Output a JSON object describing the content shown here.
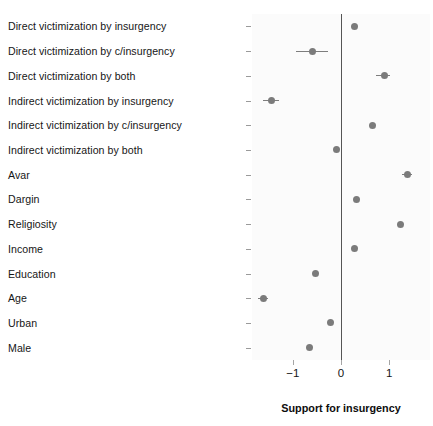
{
  "chart_data": {
    "type": "scatter",
    "title": "",
    "subtitle": "",
    "xlabel": "Support for insurgency",
    "ylabel": "",
    "xlim": [
      -1.85,
      1.85
    ],
    "xticks": [
      -1,
      0,
      1
    ],
    "xticklabels": [
      "−1",
      "0",
      "1"
    ],
    "grid": false,
    "legend": null,
    "reference_line": {
      "x": 0,
      "label": "zero-line"
    },
    "orientation": "horizontal",
    "categories": [
      "Direct victimization by insurgency",
      "Direct victimization by c/insurgency",
      "Direct victimization by both",
      "Indirect victimization by insurgency",
      "Indirect victimization by c/insurgency",
      "Indirect victimization by both",
      "Avar",
      "Dargin",
      "Religiosity",
      "Income",
      "Education",
      "Age",
      "Urban",
      "Male"
    ],
    "values": [
      0.28,
      -0.59,
      0.91,
      -1.45,
      0.65,
      -0.09,
      1.39,
      0.33,
      1.24,
      0.28,
      -0.53,
      -1.62,
      -0.22,
      -0.65
    ],
    "ci_low": [
      0.28,
      -0.93,
      0.73,
      -1.62,
      0.65,
      -0.09,
      1.27,
      0.33,
      1.24,
      0.28,
      -0.53,
      -1.73,
      -0.22,
      -0.65
    ],
    "ci_high": [
      0.28,
      -0.26,
      1.02,
      -1.28,
      0.65,
      -0.09,
      1.48,
      0.33,
      1.24,
      0.28,
      -0.53,
      -1.51,
      -0.22,
      -0.65
    ],
    "points": [
      {
        "label": "Direct victimization by insurgency",
        "value": 0.28,
        "ci_low": 0.28,
        "ci_high": 0.28
      },
      {
        "label": "Direct victimization by c/insurgency",
        "value": -0.59,
        "ci_low": -0.93,
        "ci_high": -0.26
      },
      {
        "label": "Direct victimization by both",
        "value": 0.91,
        "ci_low": 0.73,
        "ci_high": 1.02
      },
      {
        "label": "Indirect victimization by insurgency",
        "value": -1.45,
        "ci_low": -1.62,
        "ci_high": -1.28
      },
      {
        "label": "Indirect victimization by c/insurgency",
        "value": 0.65,
        "ci_low": 0.65,
        "ci_high": 0.65
      },
      {
        "label": "Indirect victimization by both",
        "value": -0.09,
        "ci_low": -0.09,
        "ci_high": -0.09
      },
      {
        "label": "Avar",
        "value": 1.39,
        "ci_low": 1.27,
        "ci_high": 1.48
      },
      {
        "label": "Dargin",
        "value": 0.33,
        "ci_low": 0.33,
        "ci_high": 0.33
      },
      {
        "label": "Religiosity",
        "value": 1.24,
        "ci_low": 1.24,
        "ci_high": 1.24
      },
      {
        "label": "Income",
        "value": 0.28,
        "ci_low": 0.28,
        "ci_high": 0.28
      },
      {
        "label": "Education",
        "value": -0.53,
        "ci_low": -0.53,
        "ci_high": -0.53
      },
      {
        "label": "Age",
        "value": -1.62,
        "ci_low": -1.73,
        "ci_high": -1.51
      },
      {
        "label": "Urban",
        "value": -0.22,
        "ci_low": -0.22,
        "ci_high": -0.22
      },
      {
        "label": "Male",
        "value": -0.65,
        "ci_low": -0.65,
        "ci_high": -0.65
      }
    ],
    "colors": {
      "point": "#7b7b7b",
      "errorbar": "#7d7d7d",
      "reference_line": "#555555",
      "panel_background": "#fbfbfb",
      "text": "#161616"
    }
  }
}
